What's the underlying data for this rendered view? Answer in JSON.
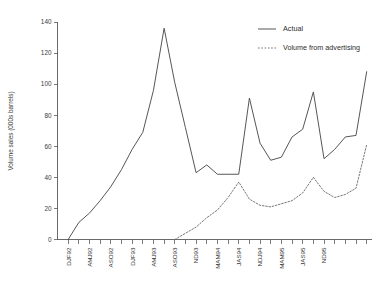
{
  "chart_data": {
    "type": "line",
    "title": "",
    "subtitle": "",
    "xlabel": "",
    "ylabel": "Volume sales (000s barrels)",
    "ylim": [
      0,
      140
    ],
    "yticks": [
      0,
      20,
      40,
      60,
      80,
      100,
      120,
      140
    ],
    "grid": false,
    "legend_position": "top-right",
    "categories": [
      "DJF92",
      "FMA92",
      "AMJ92",
      "JJA92",
      "ASO92",
      "OND92",
      "DJF93",
      "FMA93",
      "AMJ93",
      "JJA93",
      "ASO93",
      "OND93",
      "NDJ93",
      "JFM94",
      "MAM94",
      "MJJ94",
      "JAS94",
      "SON94",
      "NDJ94",
      "JFM95",
      "MAM95",
      "MJJ95",
      "JAS95",
      "SON95",
      "ND95",
      "DJF96",
      "FMA96",
      "AMJ96"
    ],
    "xtick_labels_shown": [
      "DJF92",
      "AMJ92",
      "ASO92",
      "DJF93",
      "AMJ93",
      "ASO93",
      "ND93",
      "MAM94",
      "JAS94",
      "NDJ94",
      "MAM95",
      "JAS95",
      "ND95"
    ],
    "xtick_label_interval": 2,
    "series": [
      {
        "name": "Actual",
        "style": "solid",
        "color": "#4d4d4d",
        "values": [
          0,
          11,
          17,
          25,
          34,
          45,
          58,
          69,
          96,
          136,
          101,
          72,
          43,
          48,
          42,
          42,
          42,
          91,
          62,
          51,
          53,
          66,
          71,
          95,
          52,
          58,
          66,
          67
        ]
      },
      {
        "name": "Volume from advertising",
        "style": "dotted",
        "color": "#6e6e6e",
        "values": [
          null,
          null,
          null,
          null,
          null,
          null,
          null,
          null,
          null,
          null,
          0,
          4,
          8,
          14,
          19,
          27,
          37,
          26,
          22,
          21,
          23,
          25,
          30,
          40,
          31,
          27,
          29,
          33
        ]
      }
    ],
    "series_tail_actual": [
      67,
      108
    ],
    "series_tail_advertising": [
      33,
      61
    ],
    "annotations": []
  },
  "legend": {
    "entries": [
      {
        "label": "Actual",
        "style": "solid"
      },
      {
        "label": "Volume from advertising",
        "style": "dotted"
      }
    ]
  }
}
